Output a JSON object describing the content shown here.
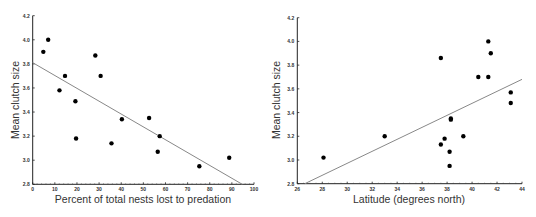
{
  "chart_data": [
    {
      "type": "scatter",
      "title": "",
      "xlabel": "Percent of total nests lost to predation",
      "ylabel": "Mean clutch size",
      "xlim": [
        0,
        100
      ],
      "ylim": [
        2.8,
        4.2
      ],
      "xticks": [
        "0",
        "10",
        "20",
        "30",
        "40",
        "50",
        "60",
        "70",
        "80",
        "90",
        "100"
      ],
      "yticks": [
        "2.8",
        "3.0",
        "3.2",
        "3.4",
        "3.6",
        "3.8",
        "4.0",
        "4.2"
      ],
      "grid": false,
      "points": [
        {
          "x": 4.8,
          "y": 3.9
        },
        {
          "x": 7.0,
          "y": 4.0
        },
        {
          "x": 12.1,
          "y": 3.58
        },
        {
          "x": 14.6,
          "y": 3.7
        },
        {
          "x": 19.3,
          "y": 3.49
        },
        {
          "x": 19.6,
          "y": 3.18
        },
        {
          "x": 28.3,
          "y": 3.87
        },
        {
          "x": 30.7,
          "y": 3.7
        },
        {
          "x": 35.6,
          "y": 3.14
        },
        {
          "x": 40.3,
          "y": 3.34
        },
        {
          "x": 52.6,
          "y": 3.35
        },
        {
          "x": 56.5,
          "y": 3.07
        },
        {
          "x": 57.4,
          "y": 3.2
        },
        {
          "x": 75.3,
          "y": 2.95
        },
        {
          "x": 88.8,
          "y": 3.02
        }
      ],
      "fit_line": {
        "x1": 0,
        "y1": 3.81,
        "x2": 94.7,
        "y2": 2.8
      }
    },
    {
      "type": "scatter",
      "title": "",
      "xlabel": "Latitude (degrees north)",
      "ylabel": "Mean clutch size",
      "xlim": [
        26,
        44
      ],
      "ylim": [
        2.8,
        4.2
      ],
      "xticks": [
        "26",
        "28",
        "30",
        "32",
        "34",
        "36",
        "38",
        "40",
        "42",
        "44"
      ],
      "yticks": [
        "2.8",
        "3.0",
        "3.2",
        "3.4",
        "3.6",
        "3.8",
        "4.0",
        "4.2"
      ],
      "grid": false,
      "points": [
        {
          "x": 28.1,
          "y": 3.02
        },
        {
          "x": 33.0,
          "y": 3.2
        },
        {
          "x": 37.5,
          "y": 3.86
        },
        {
          "x": 37.5,
          "y": 3.13
        },
        {
          "x": 37.8,
          "y": 3.18
        },
        {
          "x": 38.2,
          "y": 3.07
        },
        {
          "x": 38.2,
          "y": 2.95
        },
        {
          "x": 38.3,
          "y": 3.34
        },
        {
          "x": 38.3,
          "y": 3.35
        },
        {
          "x": 39.3,
          "y": 3.2
        },
        {
          "x": 40.5,
          "y": 3.7
        },
        {
          "x": 41.3,
          "y": 3.7
        },
        {
          "x": 41.3,
          "y": 4.0
        },
        {
          "x": 41.5,
          "y": 3.9
        },
        {
          "x": 43.1,
          "y": 3.57
        },
        {
          "x": 43.1,
          "y": 3.48
        }
      ],
      "fit_line": {
        "x1": 26.6,
        "y1": 2.8,
        "x2": 44,
        "y2": 3.68
      }
    }
  ]
}
